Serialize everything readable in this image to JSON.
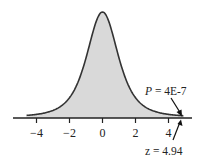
{
  "chart_data": {
    "type": "area",
    "title": "",
    "xlabel": "",
    "ylabel": "",
    "xlim": [
      -4.7,
      5.3
    ],
    "xticks": [
      -4,
      -2,
      0,
      2,
      4
    ],
    "xtick_labels": [
      "−4",
      "−2",
      "0",
      "2",
      "4"
    ],
    "grid": false,
    "legend": null,
    "distribution": "bell-shaped density (heavy-tailed, t-like), centered at 0",
    "series": [
      {
        "name": "density",
        "x": [
          -4.5,
          -4,
          -3,
          -2,
          -1.5,
          -1,
          -0.5,
          0,
          0.5,
          1,
          1.5,
          2,
          3,
          4,
          4.94
        ],
        "y": [
          0.01,
          0.013,
          0.03,
          0.07,
          0.11,
          0.2,
          0.33,
          0.39,
          0.33,
          0.2,
          0.11,
          0.07,
          0.03,
          0.013,
          0.005
        ],
        "fill": "#d9d9d9",
        "line": "#333333"
      }
    ],
    "annotations": [
      {
        "text": "P = 4E-7",
        "points_to_x": 4.94,
        "position": "above-right"
      },
      {
        "text": "z = 4.94",
        "points_to_x": 4.94,
        "position": "below-right"
      }
    ]
  },
  "labels": {
    "p_value": "P = 4E-7",
    "p_italic": "P",
    "p_rest": " = 4E-7",
    "z_value": "z = 4.94"
  },
  "colors": {
    "fill": "#d9d9d9",
    "line": "#333333",
    "axis": "#222222"
  }
}
